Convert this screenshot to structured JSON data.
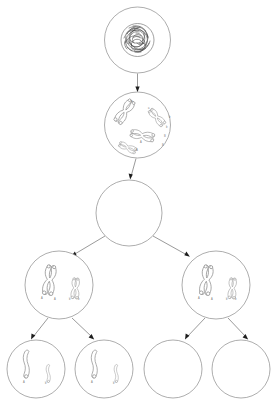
{
  "diagram": {
    "type": "meiosis-flowchart",
    "colors": {
      "background": "#ffffff",
      "membrane_stroke": "#8a8a8a",
      "chromatin_stroke": "#3a3a3a",
      "chromosome_stroke": "#8a8a8a",
      "arrow_stroke": "#6f6f6f",
      "arrowhead_fill": "#1d1d1d",
      "label_text": "#7a7a7a"
    },
    "rows": [
      {
        "row_index": 0,
        "label": "parent-cell-interphase",
        "cell_count": 1,
        "content": "tangled-chromatin-nucleus"
      },
      {
        "row_index": 1,
        "label": "cell-condensed-chromosomes",
        "cell_count": 1,
        "content": "four-duplicated-chromosomes"
      },
      {
        "row_index": 2,
        "label": "cell-empty-large",
        "cell_count": 1,
        "content": "empty"
      },
      {
        "row_index": 3,
        "label": "daughter-cells-first-division",
        "cell_count": 2,
        "content": "two-duplicated-chromosomes"
      },
      {
        "row_index": 4,
        "label": "daughter-cells-second-division",
        "cell_count": 4,
        "content": "two-single-chromatids-or-empty"
      }
    ],
    "cells": [
      {
        "id": "cell-1",
        "name": "parent-cell",
        "cx": 137.5,
        "cy": 40,
        "r": 33,
        "contents": "chromatin",
        "chromosome_labels": []
      },
      {
        "id": "cell-2",
        "name": "cell-prophase",
        "cx": 137.5,
        "cy": 125,
        "r": 33,
        "contents": "duplicated-chromosomes-4",
        "chromosome_labels": [
          "a",
          "a",
          "b",
          "b",
          "B",
          "B",
          "A",
          "A"
        ]
      },
      {
        "id": "cell-3",
        "name": "cell-empty-large",
        "cx": 129,
        "cy": 213,
        "r": 33,
        "contents": "empty",
        "chromosome_labels": []
      },
      {
        "id": "cell-4",
        "name": "daughter-cell-left",
        "cx": 59,
        "cy": 285,
        "r": 34,
        "contents": "duplicated-chromosomes-2",
        "chromosome_labels": [
          "A",
          "A",
          "b",
          "b"
        ]
      },
      {
        "id": "cell-5",
        "name": "daughter-cell-right",
        "cx": 216,
        "cy": 285,
        "r": 34,
        "contents": "duplicated-chromosomes-2",
        "chromosome_labels": [
          "A",
          "A",
          "b",
          "b"
        ]
      },
      {
        "id": "cell-6",
        "name": "grand-daughter-cell-1",
        "cx": 36,
        "cy": 369,
        "r": 29,
        "contents": "single-chromatids-2",
        "chromosome_labels": [
          "A",
          "b"
        ]
      },
      {
        "id": "cell-7",
        "name": "grand-daughter-cell-2",
        "cx": 104,
        "cy": 369,
        "r": 29,
        "contents": "single-chromatids-2",
        "chromosome_labels": [
          "A",
          "b"
        ]
      },
      {
        "id": "cell-8",
        "name": "grand-daughter-cell-3",
        "cx": 173,
        "cy": 369,
        "r": 29,
        "contents": "empty",
        "chromosome_labels": []
      },
      {
        "id": "cell-9",
        "name": "grand-daughter-cell-4",
        "cx": 241,
        "cy": 369,
        "r": 29,
        "contents": "empty",
        "chromosome_labels": []
      }
    ],
    "arrows": [
      {
        "id": "arrow-1",
        "name": "arrow-cell1-to-cell2",
        "from": "cell-1",
        "to": "cell-2",
        "direction": "down"
      },
      {
        "id": "arrow-2",
        "name": "arrow-cell2-to-cell3",
        "from": "cell-2",
        "to": "cell-3",
        "direction": "down"
      },
      {
        "id": "arrow-3",
        "name": "arrow-cell3-to-cell4",
        "from": "cell-3",
        "to": "cell-4",
        "direction": "down-left"
      },
      {
        "id": "arrow-4",
        "name": "arrow-cell3-to-cell5",
        "from": "cell-3",
        "to": "cell-5",
        "direction": "down-right"
      },
      {
        "id": "arrow-5",
        "name": "arrow-cell4-to-cell6",
        "from": "cell-4",
        "to": "cell-6",
        "direction": "down-left"
      },
      {
        "id": "arrow-6",
        "name": "arrow-cell4-to-cell7",
        "from": "cell-4",
        "to": "cell-7",
        "direction": "down-right"
      },
      {
        "id": "arrow-7",
        "name": "arrow-cell5-to-cell8",
        "from": "cell-5",
        "to": "cell-8",
        "direction": "down-left"
      },
      {
        "id": "arrow-8",
        "name": "arrow-cell5-to-cell9",
        "from": "cell-5",
        "to": "cell-9",
        "direction": "down-right"
      }
    ]
  }
}
